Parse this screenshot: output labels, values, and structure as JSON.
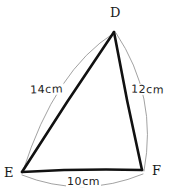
{
  "figure": {
    "kind": "hand-drawn-geometry-diagram",
    "shape": "triangle",
    "background_color": "#ffffff",
    "stroke_color": "#111111",
    "arc_color": "#8a8a8a",
    "vertices": [
      {
        "id": "D",
        "label": "D",
        "x": 114,
        "y": 32
      },
      {
        "id": "E",
        "label": "E",
        "x": 22,
        "y": 172
      },
      {
        "id": "F",
        "label": "F",
        "x": 142,
        "y": 170
      }
    ],
    "sides": [
      {
        "id": "DE",
        "from": "D",
        "to": "E",
        "length_label": "14cm"
      },
      {
        "id": "DF",
        "from": "D",
        "to": "F",
        "length_label": "12cm"
      },
      {
        "id": "EF",
        "from": "E",
        "to": "F",
        "length_label": "10cm"
      }
    ],
    "arcs": {
      "de": "M 114 33 Q 55 70 23 171",
      "df": "M 116 33 Q 158 96 144 171",
      "ef": "M 22 175 Q 82 199 143 174"
    }
  }
}
